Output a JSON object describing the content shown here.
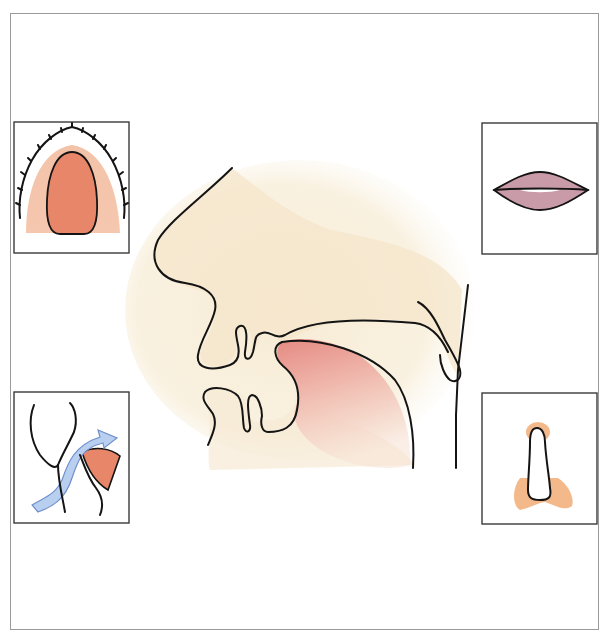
{
  "figure": {
    "title": "",
    "colors": {
      "skin": "#f6ead2",
      "tongue": "#e8867a",
      "palate_light": "#f5c4a8",
      "palate_dark": "#e8866a",
      "lips": "#c99aa8",
      "airflow": "#b9cff0",
      "airflow_stroke": "#6f8fcc",
      "nose_tissue": "#f3b98a",
      "outline": "#141414",
      "frame": "#9a9a9a"
    }
  },
  "panels": [
    {
      "id": "palate",
      "position": "top-left",
      "depicts": "upper palate with dental arch viewed from below"
    },
    {
      "id": "lips",
      "position": "top-right",
      "depicts": "closed lips front view"
    },
    {
      "id": "airflow",
      "position": "bottom-left",
      "depicts": "airflow arrow passing soft palate / tongue"
    },
    {
      "id": "nostril",
      "position": "bottom-right",
      "depicts": "nasal passage opening outline with surrounding tissue"
    }
  ],
  "main_profile": {
    "structures": [
      "nose",
      "upper-lip",
      "upper-teeth",
      "lower-lip",
      "lower-teeth",
      "tongue",
      "palate",
      "uvula",
      "pharynx-wall"
    ]
  }
}
